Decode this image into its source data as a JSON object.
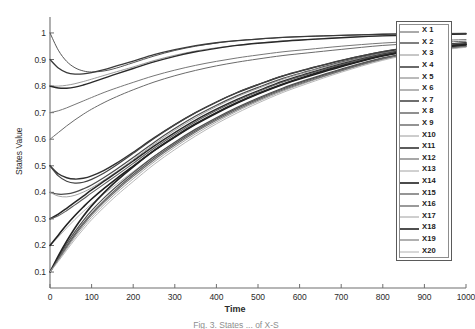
{
  "figure": {
    "caption": "Fig. 3. States ... of X-S"
  },
  "chart_data": {
    "type": "line",
    "title": "",
    "xlabel": "Time",
    "ylabel": "States Value",
    "xlim": [
      0,
      1000
    ],
    "ylim": [
      0.04,
      1.06
    ],
    "xticks": [
      0,
      100,
      200,
      300,
      400,
      500,
      600,
      700,
      800,
      900,
      1000
    ],
    "yticks": [
      0.1,
      0.2,
      0.3,
      0.4,
      0.5,
      0.6,
      0.7,
      0.8,
      0.9,
      1
    ],
    "ytick_labels": [
      "0.1",
      "0.2",
      "0.3",
      "0.4",
      "0.5",
      "0.6",
      "0.7",
      "0.8",
      "0.9",
      "1"
    ],
    "xtick_labels": [
      "0",
      "100",
      "200",
      "300",
      "400",
      "500",
      "600",
      "700",
      "800",
      "900",
      "1000"
    ],
    "grid": false,
    "legend_position": "right-outside",
    "x": [
      0,
      20,
      40,
      60,
      80,
      100,
      130,
      160,
      200,
      250,
      300,
      350,
      400,
      450,
      500,
      560,
      620,
      700,
      800,
      900,
      1000
    ],
    "series": [
      {
        "name": "X 1",
        "color": "#555555",
        "width": 1.0,
        "values": [
          1.0,
          0.935,
          0.893,
          0.869,
          0.857,
          0.853,
          0.857,
          0.868,
          0.888,
          0.913,
          0.934,
          0.95,
          0.962,
          0.971,
          0.977,
          0.983,
          0.987,
          0.991,
          0.995,
          0.997,
          0.998
        ]
      },
      {
        "name": "X 2",
        "color": "#3a3a3a",
        "width": 1.3,
        "values": [
          0.9,
          0.868,
          0.851,
          0.845,
          0.846,
          0.851,
          0.862,
          0.876,
          0.894,
          0.918,
          0.937,
          0.952,
          0.963,
          0.971,
          0.977,
          0.983,
          0.987,
          0.991,
          0.995,
          0.997,
          0.998
        ]
      },
      {
        "name": "X 3",
        "color": "#8e8e8e",
        "width": 0.9,
        "values": [
          0.8,
          0.8,
          0.803,
          0.809,
          0.817,
          0.826,
          0.84,
          0.854,
          0.872,
          0.896,
          0.916,
          0.932,
          0.944,
          0.954,
          0.962,
          0.97,
          0.976,
          0.983,
          0.99,
          0.994,
          0.996
        ]
      },
      {
        "name": "X 4",
        "color": "#2a2a2a",
        "width": 1.4,
        "values": [
          0.8,
          0.793,
          0.792,
          0.796,
          0.804,
          0.814,
          0.83,
          0.846,
          0.866,
          0.891,
          0.912,
          0.929,
          0.942,
          0.953,
          0.961,
          0.969,
          0.975,
          0.982,
          0.989,
          0.993,
          0.996
        ]
      },
      {
        "name": "X 5",
        "color": "#777777",
        "width": 1.0,
        "values": [
          0.7,
          0.707,
          0.718,
          0.731,
          0.744,
          0.757,
          0.776,
          0.793,
          0.814,
          0.839,
          0.86,
          0.878,
          0.893,
          0.906,
          0.917,
          0.929,
          0.938,
          0.95,
          0.962,
          0.97,
          0.975
        ]
      },
      {
        "name": "X 6",
        "color": "#6b6b6b",
        "width": 1.0,
        "values": [
          0.6,
          0.625,
          0.65,
          0.673,
          0.694,
          0.713,
          0.738,
          0.76,
          0.786,
          0.815,
          0.839,
          0.859,
          0.876,
          0.89,
          0.902,
          0.915,
          0.925,
          0.938,
          0.953,
          0.962,
          0.969
        ]
      },
      {
        "name": "X 7",
        "color": "#303030",
        "width": 1.4,
        "values": [
          0.5,
          0.47,
          0.455,
          0.45,
          0.453,
          0.462,
          0.483,
          0.51,
          0.551,
          0.605,
          0.655,
          0.7,
          0.74,
          0.775,
          0.805,
          0.838,
          0.864,
          0.896,
          0.929,
          0.95,
          0.963
        ]
      },
      {
        "name": "X 8",
        "color": "#444444",
        "width": 1.2,
        "values": [
          0.5,
          0.462,
          0.442,
          0.435,
          0.438,
          0.449,
          0.473,
          0.503,
          0.547,
          0.603,
          0.654,
          0.7,
          0.74,
          0.776,
          0.806,
          0.839,
          0.865,
          0.897,
          0.93,
          0.951,
          0.963
        ]
      },
      {
        "name": "X 9",
        "color": "#4a4a4a",
        "width": 1.2,
        "values": [
          0.4,
          0.393,
          0.394,
          0.401,
          0.413,
          0.428,
          0.456,
          0.487,
          0.531,
          0.588,
          0.64,
          0.687,
          0.728,
          0.764,
          0.795,
          0.829,
          0.856,
          0.89,
          0.925,
          0.947,
          0.961
        ]
      },
      {
        "name": "X10",
        "color": "#9a9a9a",
        "width": 0.9,
        "values": [
          0.4,
          0.386,
          0.383,
          0.389,
          0.401,
          0.417,
          0.446,
          0.478,
          0.523,
          0.581,
          0.634,
          0.681,
          0.723,
          0.76,
          0.791,
          0.826,
          0.854,
          0.888,
          0.923,
          0.946,
          0.96
        ]
      },
      {
        "name": "X11",
        "color": "#262626",
        "width": 1.5,
        "values": [
          0.3,
          0.318,
          0.34,
          0.363,
          0.386,
          0.409,
          0.442,
          0.474,
          0.518,
          0.574,
          0.625,
          0.672,
          0.713,
          0.75,
          0.782,
          0.818,
          0.847,
          0.883,
          0.92,
          0.944,
          0.958
        ]
      },
      {
        "name": "X12",
        "color": "#5f5f5f",
        "width": 1.1,
        "values": [
          0.3,
          0.312,
          0.331,
          0.353,
          0.375,
          0.398,
          0.431,
          0.464,
          0.509,
          0.566,
          0.618,
          0.666,
          0.708,
          0.746,
          0.779,
          0.815,
          0.845,
          0.881,
          0.919,
          0.943,
          0.957
        ]
      },
      {
        "name": "X13",
        "color": "#a2a2a2",
        "width": 0.9,
        "values": [
          0.2,
          0.232,
          0.266,
          0.298,
          0.328,
          0.356,
          0.395,
          0.431,
          0.478,
          0.536,
          0.588,
          0.636,
          0.679,
          0.718,
          0.753,
          0.791,
          0.823,
          0.862,
          0.905,
          0.933,
          0.95
        ]
      },
      {
        "name": "X14",
        "color": "#1f1f1f",
        "width": 1.6,
        "values": [
          0.2,
          0.239,
          0.278,
          0.313,
          0.345,
          0.375,
          0.415,
          0.452,
          0.499,
          0.557,
          0.608,
          0.656,
          0.698,
          0.736,
          0.77,
          0.806,
          0.836,
          0.873,
          0.913,
          0.939,
          0.955
        ]
      },
      {
        "name": "X15",
        "color": "#4f4f4f",
        "width": 1.2,
        "values": [
          0.1,
          0.155,
          0.206,
          0.252,
          0.294,
          0.331,
          0.379,
          0.422,
          0.474,
          0.535,
          0.589,
          0.638,
          0.681,
          0.72,
          0.755,
          0.793,
          0.825,
          0.864,
          0.906,
          0.934,
          0.951
        ]
      },
      {
        "name": "X16",
        "color": "#585858",
        "width": 1.2,
        "values": [
          0.1,
          0.15,
          0.198,
          0.243,
          0.284,
          0.321,
          0.369,
          0.413,
          0.466,
          0.528,
          0.583,
          0.632,
          0.676,
          0.716,
          0.751,
          0.789,
          0.822,
          0.861,
          0.904,
          0.933,
          0.95
        ]
      },
      {
        "name": "X17",
        "color": "#9e9e9e",
        "width": 0.9,
        "values": [
          0.1,
          0.144,
          0.188,
          0.231,
          0.27,
          0.306,
          0.354,
          0.398,
          0.451,
          0.514,
          0.57,
          0.62,
          0.665,
          0.706,
          0.742,
          0.781,
          0.815,
          0.856,
          0.9,
          0.93,
          0.948
        ]
      },
      {
        "name": "X18",
        "color": "#232323",
        "width": 1.6,
        "values": [
          0.1,
          0.161,
          0.216,
          0.266,
          0.31,
          0.349,
          0.399,
          0.443,
          0.496,
          0.557,
          0.61,
          0.658,
          0.7,
          0.738,
          0.772,
          0.808,
          0.839,
          0.876,
          0.915,
          0.941,
          0.956
        ]
      },
      {
        "name": "X19",
        "color": "#6f6f6f",
        "width": 1.1,
        "values": [
          0.1,
          0.148,
          0.194,
          0.238,
          0.278,
          0.315,
          0.363,
          0.407,
          0.46,
          0.522,
          0.577,
          0.627,
          0.671,
          0.711,
          0.747,
          0.785,
          0.818,
          0.858,
          0.902,
          0.931,
          0.949
        ]
      },
      {
        "name": "X20",
        "color": "#b0b0b0",
        "width": 0.9,
        "values": [
          0.1,
          0.14,
          0.182,
          0.223,
          0.261,
          0.297,
          0.344,
          0.388,
          0.441,
          0.505,
          0.561,
          0.612,
          0.658,
          0.699,
          0.736,
          0.776,
          0.81,
          0.852,
          0.897,
          0.928,
          0.946
        ]
      }
    ]
  }
}
